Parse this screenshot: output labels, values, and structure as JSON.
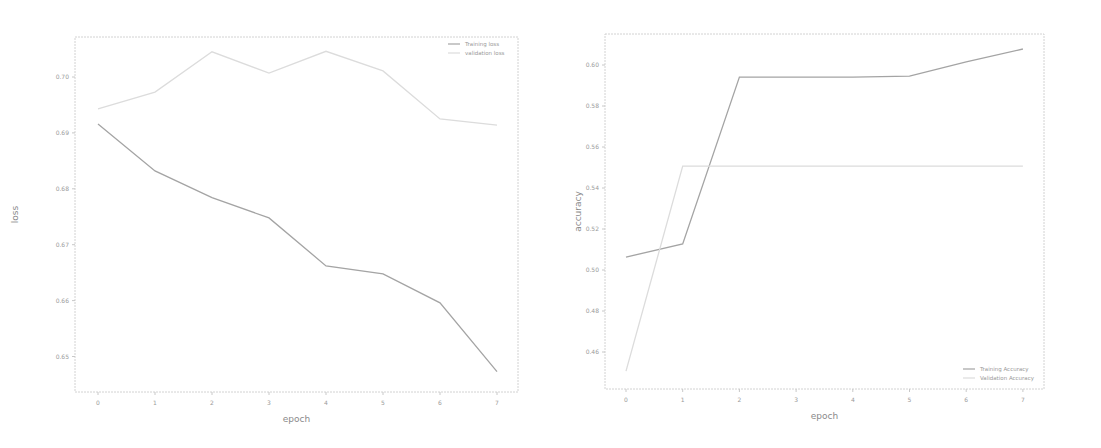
{
  "chart_data": [
    {
      "type": "line",
      "title": "",
      "xlabel": "epoch",
      "ylabel": "loss",
      "x": [
        0,
        1,
        2,
        3,
        4,
        5,
        6,
        7
      ],
      "xticks": [
        "0",
        "1",
        "2",
        "3",
        "4",
        "5",
        "6",
        "7"
      ],
      "yticks": [
        "0.70",
        "0.69",
        "0.68",
        "0.67",
        "0.66",
        "0.65"
      ],
      "ylim": [
        0.646,
        0.707
      ],
      "grid": false,
      "legend_position": "upper right",
      "series": [
        {
          "name": "Training loss",
          "color": "#a4a4a4",
          "values": [
            0.6916,
            0.6832,
            0.6784,
            0.6748,
            0.6662,
            0.6648,
            0.6596,
            0.6473
          ]
        },
        {
          "name": "validation loss",
          "color": "#dcdcdc",
          "values": [
            0.6943,
            0.6973,
            0.7045,
            0.7007,
            0.7046,
            0.7011,
            0.6925,
            0.6914
          ]
        }
      ]
    },
    {
      "type": "line",
      "title": "",
      "xlabel": "epoch",
      "ylabel": "accuracy",
      "x": [
        0,
        1,
        2,
        3,
        4,
        5,
        6,
        7
      ],
      "xticks": [
        "0",
        "1",
        "2",
        "3",
        "4",
        "5",
        "6",
        "7"
      ],
      "yticks": [
        "0.60",
        "0.58",
        "0.56",
        "0.54",
        "0.52",
        "0.50",
        "0.48",
        "0.46"
      ],
      "ylim": [
        0.445,
        0.615
      ],
      "grid": false,
      "legend_position": "lower right",
      "series": [
        {
          "name": "Training Accuracy",
          "color": "#a4a4a4",
          "values": [
            0.5063,
            0.5127,
            0.5941,
            0.5941,
            0.5941,
            0.5946,
            0.6015,
            0.6078
          ]
        },
        {
          "name": "Validation Accuracy",
          "color": "#dcdcdc",
          "values": [
            0.4507,
            0.5507,
            0.5507,
            0.5507,
            0.5507,
            0.5507,
            0.5507,
            0.5507
          ]
        }
      ]
    }
  ]
}
